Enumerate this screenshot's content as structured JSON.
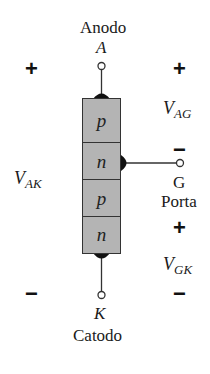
{
  "diagram": {
    "anode": {
      "name": "Anodo",
      "symbol": "A"
    },
    "cathode": {
      "name": "Catodo",
      "symbol": "K"
    },
    "gate": {
      "symbol": "G",
      "name": "Porta"
    },
    "layers": [
      "p",
      "n",
      "p",
      "n"
    ],
    "voltages": {
      "vak": {
        "base": "V",
        "sub": "AK",
        "plus": "+",
        "minus": "−"
      },
      "vag": {
        "base": "V",
        "sub": "AG",
        "plus": "+",
        "minus": "−"
      },
      "vgk": {
        "base": "V",
        "sub": "GK",
        "plus": "+",
        "minus": "−"
      }
    },
    "colors": {
      "layer_fill": "#b4b4b4",
      "stroke": "#333333"
    }
  }
}
